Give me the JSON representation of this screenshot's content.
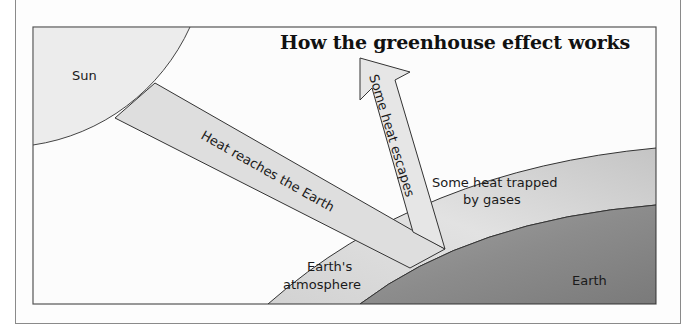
{
  "title": "How the greenhouse effect works",
  "labels": {
    "sun": "Sun",
    "heat_in": "Heat reaches the Earth",
    "heat_out": "Some heat escapes",
    "trapped_line1": "Some heat trapped",
    "trapped_line2": "by gases",
    "atmosphere_line1": "Earth's",
    "atmosphere_line2": "atmosphere",
    "earth": "Earth"
  },
  "colors": {
    "sun": "#ececec",
    "beam": "#dcdcdc",
    "atmosphere": "#c9c9c9",
    "earth": "#8f8f8f",
    "outline": "#333333"
  }
}
